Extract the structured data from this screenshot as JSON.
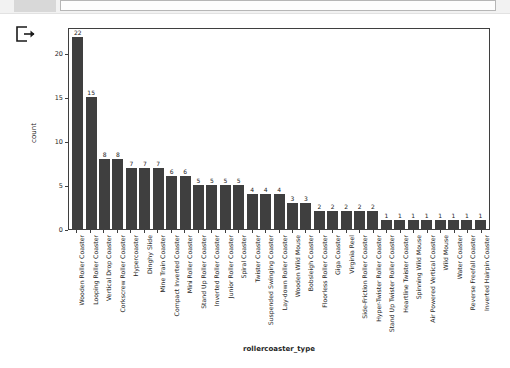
{
  "window": {
    "chrome_tab_label": "",
    "chrome_field_value": ""
  },
  "icons": {
    "export": "export-icon"
  },
  "chart_data": {
    "type": "bar",
    "title": "",
    "xlabel": "rollercoaster_type",
    "ylabel": "count",
    "ylim": [
      0,
      23
    ],
    "yticks": [
      0,
      5,
      10,
      15,
      20
    ],
    "grid": false,
    "legend": "none",
    "bar_color": "#3f3f3f",
    "categories": [
      "Wooden Roller Coaster",
      "Looping Roller Coaster",
      "Vertical Drop Coaster",
      "Corkscrew Roller Coaster",
      "Hypercoaster",
      "Dinghy Slide",
      "Mine Train Coaster",
      "Compact Inverted Coaster",
      "Mini Roller Coaster",
      "Stand Up Roller Coaster",
      "Inverted Roller Coaster",
      "Junior Roller Coaster",
      "Spiral Coaster",
      "Twister Coaster",
      "Suspended Swinging Coaster",
      "Lay-down Roller Coaster",
      "Wooden Wild Mouse",
      "Bobsleigh Coaster",
      "Floorless Roller Coaster",
      "Giga Coaster",
      "Virginia Reel",
      "Side-Friction Roller Coaster",
      "Hyper-Twister Roller Coaster",
      "Stand Up Twister Roller Coaster",
      "Heartline Twister Coaster",
      "Spinning Wild Mouse",
      "Air Powered Vertical Coaster",
      "Wild Mouse",
      "Water Coaster",
      "Reverse Freefall Coaster",
      "Inverted Hairpin Coaster"
    ],
    "values": [
      22,
      15,
      8,
      8,
      7,
      7,
      7,
      6,
      6,
      5,
      5,
      5,
      5,
      4,
      4,
      4,
      3,
      3,
      2,
      2,
      2,
      2,
      2,
      1,
      1,
      1,
      1,
      1,
      1,
      1,
      1
    ]
  }
}
